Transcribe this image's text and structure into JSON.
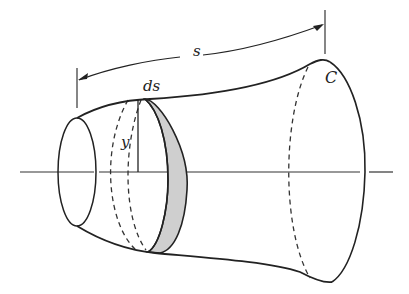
{
  "figure": {
    "type": "surface-of-revolution",
    "labels": {
      "s": "s",
      "ds": "ds",
      "y": "y",
      "curve": "C"
    },
    "colors": {
      "stroke": "#222222",
      "band_fill": "#cfcfcf",
      "axis": "#333333"
    }
  }
}
